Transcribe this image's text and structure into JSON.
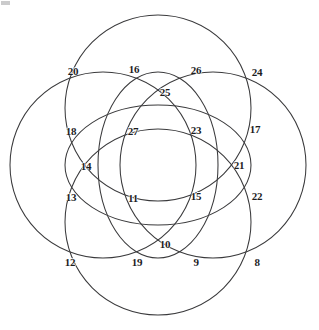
{
  "figure": {
    "width": 319,
    "height": 330,
    "background_color": "#ffffff",
    "stroke_color": "#3a3a3c",
    "label_color": "#1d1d1f",
    "stroke_width": 1.05
  },
  "chart_data": {
    "type": "diagram",
    "shape_count": 6,
    "label_count": 20,
    "label_range": [
      8,
      27
    ],
    "grid": false,
    "legend": null,
    "circles": [
      {
        "name": "top-circle",
        "cx": 158,
        "cy": 108,
        "r": 93
      },
      {
        "name": "bottom-circle",
        "cx": 158,
        "cy": 222,
        "r": 93
      },
      {
        "name": "left-circle",
        "cx": 103,
        "cy": 165,
        "r": 93
      },
      {
        "name": "right-circle",
        "cx": 213,
        "cy": 165,
        "r": 93
      },
      {
        "name": "inner-tall-ellipse",
        "cx": 158,
        "cy": 165,
        "rx": 60,
        "ry": 93
      },
      {
        "name": "inner-wide-ellipse",
        "cx": 158,
        "cy": 165,
        "rx": 93,
        "ry": 60
      }
    ],
    "nodes": [
      {
        "label": "20",
        "x": 73,
        "y": 71
      },
      {
        "label": "16",
        "x": 134,
        "y": 69
      },
      {
        "label": "26",
        "x": 196,
        "y": 70
      },
      {
        "label": "24",
        "x": 257,
        "y": 72
      },
      {
        "label": "25",
        "x": 165,
        "y": 92
      },
      {
        "label": "18",
        "x": 71,
        "y": 131
      },
      {
        "label": "27",
        "x": 133,
        "y": 131
      },
      {
        "label": "23",
        "x": 196,
        "y": 130
      },
      {
        "label": "17",
        "x": 255,
        "y": 129
      },
      {
        "label": "14",
        "x": 86,
        "y": 166
      },
      {
        "label": "21",
        "x": 239,
        "y": 165
      },
      {
        "label": "13",
        "x": 71,
        "y": 197
      },
      {
        "label": "11",
        "x": 133,
        "y": 198
      },
      {
        "label": "15",
        "x": 196,
        "y": 196
      },
      {
        "label": "22",
        "x": 257,
        "y": 196
      },
      {
        "label": "10",
        "x": 165,
        "y": 244
      },
      {
        "label": "12",
        "x": 70,
        "y": 262
      },
      {
        "label": "19",
        "x": 137,
        "y": 262
      },
      {
        "label": "9",
        "x": 196,
        "y": 262
      },
      {
        "label": "8",
        "x": 257,
        "y": 262
      }
    ]
  }
}
